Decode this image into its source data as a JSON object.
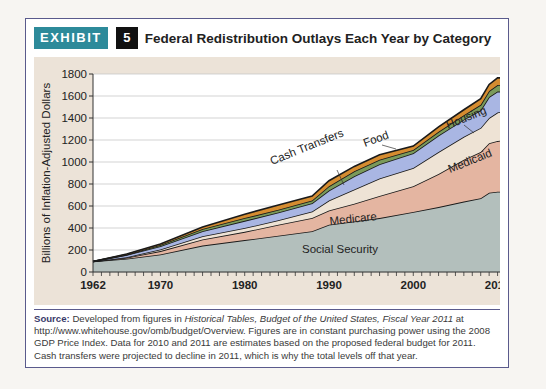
{
  "header": {
    "exhibit_label": "EXHIBIT",
    "exhibit_number": "5",
    "title": "Federal Redistribution Outlays Each Year by Category"
  },
  "colors": {
    "exhibit_bg": "#2d8a9a",
    "number_bg": "#111111",
    "chart_bg": "#ece3d8",
    "social_security": "#b3bfbc",
    "medicare": "#e4b5a1",
    "medicaid": "#eee3d5",
    "cash_transfers": "#a9b6e3",
    "food": "#7a9a5a",
    "housing": "#d58c30"
  },
  "chart_data": {
    "type": "area",
    "stacked": true,
    "title": "Federal Redistribution Outlays Each Year by Category",
    "xlabel": "",
    "ylabel": "Billions of Inflation-Adjusted Dollars",
    "ylim": [
      0,
      1800
    ],
    "yticks": [
      0,
      200,
      400,
      600,
      800,
      1000,
      1200,
      1400,
      1600,
      1800
    ],
    "xticks": [
      1962,
      1970,
      1980,
      1990,
      2000,
      2010
    ],
    "xlim": [
      1962,
      2011
    ],
    "grid": true,
    "x": [
      1962,
      1966,
      1970,
      1975,
      1980,
      1984,
      1988,
      1990,
      1993,
      1996,
      2000,
      2003,
      2006,
      2008,
      2009,
      2010,
      2011
    ],
    "series": [
      {
        "name": "Social Security",
        "values": [
          95,
          120,
          160,
          240,
          290,
          330,
          370,
          430,
          460,
          490,
          545,
          590,
          640,
          670,
          720,
          730,
          730
        ]
      },
      {
        "name": "Medicare",
        "values": [
          0,
          10,
          30,
          55,
          75,
          100,
          120,
          130,
          160,
          200,
          235,
          300,
          380,
          420,
          450,
          460,
          470
        ]
      },
      {
        "name": "Medicaid",
        "values": [
          0,
          5,
          15,
          30,
          35,
          40,
          60,
          90,
          130,
          160,
          165,
          200,
          210,
          220,
          230,
          260,
          265
        ]
      },
      {
        "name": "Cash Transfers",
        "values": [
          0,
          20,
          30,
          45,
          65,
          70,
          75,
          90,
          120,
          130,
          135,
          150,
          155,
          160,
          190,
          190,
          175
        ]
      },
      {
        "name": "Food",
        "values": [
          0,
          3,
          10,
          20,
          25,
          25,
          25,
          40,
          45,
          40,
          30,
          35,
          40,
          50,
          55,
          60,
          60
        ]
      },
      {
        "name": "Housing",
        "values": [
          0,
          5,
          10,
          20,
          35,
          45,
          40,
          50,
          45,
          45,
          35,
          45,
          50,
          55,
          60,
          65,
          65
        ]
      }
    ],
    "annotations": [
      "Social Security",
      "Medicare",
      "Medicaid",
      "Cash Transfers",
      "Food",
      "Housing"
    ]
  },
  "axis": {
    "ylabel": "Billions of Inflation-Adjusted Dollars",
    "yticks": [
      "1800",
      "1600",
      "1400",
      "1200",
      "1000",
      "800",
      "600",
      "400",
      "200",
      "0"
    ],
    "xticks": [
      "1962",
      "1970",
      "1980",
      "1990",
      "2000",
      "2010"
    ]
  },
  "labels": {
    "social_security": "Social Security",
    "medicare": "Medicare",
    "medicaid": "Medicaid",
    "cash_transfers": "Cash Transfers",
    "food": "Food",
    "housing": "Housing"
  },
  "source": {
    "label": "Source:",
    "text1": " Developed from figures in ",
    "italic": "Historical Tables, Budget of the United States, Fiscal Year 2011",
    "text2": " at http://www.whitehouse.gov/omb/budget/Overview. Figures are in constant purchasing power using the 2008 GDP Price Index. Data for 2010 and 2011 are estimates based on the proposed federal budget for 2011. Cash transfers were projected to decline in 2011, which is why the total levels off that year."
  }
}
